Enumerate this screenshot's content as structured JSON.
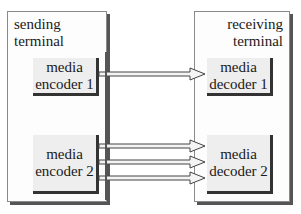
{
  "sending_terminal": {
    "label_line1": "sending",
    "label_line2": "terminal",
    "encoders": [
      {
        "line1": "media",
        "line2": "encoder 1"
      },
      {
        "line1": "media",
        "line2": "encoder 2"
      }
    ]
  },
  "receiving_terminal": {
    "label_line1": "receiving",
    "label_line2": "terminal",
    "decoders": [
      {
        "line1": "media",
        "line2": "decoder 1"
      },
      {
        "line1": "media",
        "line2": "decoder 2"
      }
    ]
  },
  "connections": [
    {
      "from": "encoder 1",
      "to": "decoder 1",
      "count": 1
    },
    {
      "from": "encoder 2",
      "to": "decoder 2",
      "count": 3
    }
  ]
}
